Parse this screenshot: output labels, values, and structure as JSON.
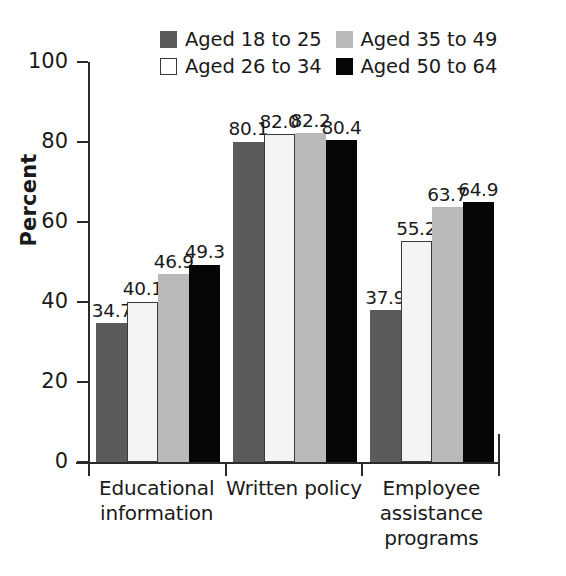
{
  "chart_data": {
    "type": "bar",
    "title": "",
    "subtitle": "",
    "xlabel": "",
    "ylabel": "Percent",
    "ylim": [
      0,
      100
    ],
    "yticks": [
      0,
      20,
      40,
      60,
      80,
      100
    ],
    "ytick_labels": [
      "0",
      "20",
      "40",
      "60",
      "80",
      "100"
    ],
    "grid": false,
    "legend_position": "top-center",
    "value_labels": true,
    "categories": [
      "Educational information",
      "Written policy",
      "Employee assistance programs"
    ],
    "category_lines": [
      [
        "Educational",
        "information"
      ],
      [
        "Written policy"
      ],
      [
        "Employee",
        "assistance",
        "programs"
      ]
    ],
    "series": [
      {
        "name": "Aged 18 to 25",
        "color": "#5b5b5b",
        "values": [
          34.7,
          80.1,
          37.9
        ],
        "labels": [
          "34.7",
          "80.1",
          "37.9"
        ]
      },
      {
        "name": "Aged 26 to 34",
        "color": "#f4f4f2",
        "values": [
          40.1,
          82.0,
          55.2
        ],
        "labels": [
          "40.1",
          "82.0",
          "55.2"
        ]
      },
      {
        "name": "Aged 35 to 49",
        "color": "#b9b9b9",
        "values": [
          46.9,
          82.2,
          63.7
        ],
        "labels": [
          "46.9",
          "82.2",
          "63.7"
        ]
      },
      {
        "name": "Aged 50 to 64",
        "color": "#060606",
        "values": [
          49.3,
          80.4,
          64.9
        ],
        "labels": [
          "49.3",
          "80.4",
          "64.9"
        ]
      }
    ]
  },
  "legend": {
    "entries": [
      {
        "label": "Aged 18 to 25",
        "swatch": "legend-swatch-dark-gray"
      },
      {
        "label": "Aged 35 to 49",
        "swatch": "legend-swatch-light-gray"
      },
      {
        "label": "Aged 26 to 34",
        "swatch": "legend-swatch-white"
      },
      {
        "label": "Aged 50 to 64",
        "swatch": "legend-swatch-black"
      }
    ]
  },
  "caption": {
    "cut_off_line": ""
  }
}
